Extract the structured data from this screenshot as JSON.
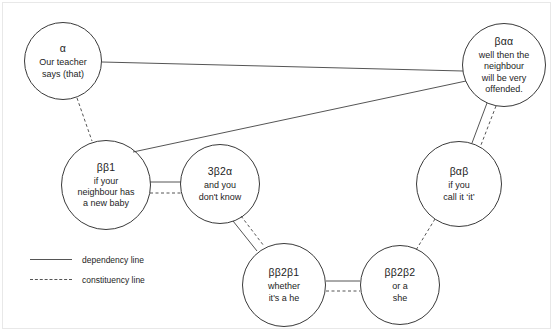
{
  "diagram": {
    "background_color": "#ffffff",
    "line_color": "#555555",
    "node_border_color": "#3a3a3a",
    "text_color": "#1d1d1d",
    "nodes": [
      {
        "id": "alpha",
        "label": "α",
        "text": "Our teacher\nsays (that)",
        "cx": 63,
        "cy": 61,
        "r": 39
      },
      {
        "id": "betaalphaalpha",
        "label": "βαα",
        "text": "well then the\nneighbour\nwill be very\noffended.",
        "cx": 504,
        "cy": 65,
        "r": 42
      },
      {
        "id": "betabeta1",
        "label": "ββ1",
        "text": "if your\nneighbour has\na new baby",
        "cx": 106,
        "cy": 185,
        "r": 45
      },
      {
        "id": "threebeta2alpha",
        "label": "3β2α",
        "text": "and you\ndon't know",
        "cx": 220,
        "cy": 184,
        "r": 40
      },
      {
        "id": "betaalphabeta",
        "label": "βαβ",
        "text": "if you\ncall it ‘it’",
        "cx": 459,
        "cy": 184,
        "r": 43
      },
      {
        "id": "betabeta2beta1",
        "label": "ββ2β1",
        "text": "whether\nit's a he",
        "cx": 284,
        "cy": 285,
        "r": 42
      },
      {
        "id": "betabeta2beta2",
        "label": "ββ2β2",
        "text": "or a\nshe",
        "cx": 400,
        "cy": 285,
        "r": 40
      }
    ],
    "edges": [
      {
        "id": "alpha-to-betaalphaalpha-dependency",
        "kind": "dependency",
        "from": "alpha",
        "to": "betaalphaalpha",
        "x1": 102,
        "y1": 62,
        "x2": 463,
        "y2": 71
      },
      {
        "id": "alpha-to-betabeta1-constituency",
        "kind": "constituency",
        "from": "alpha",
        "to": "betabeta1",
        "x1": 77,
        "y1": 98,
        "x2": 92,
        "y2": 141
      },
      {
        "id": "betabeta1-to-betaalphaalpha-dependency",
        "kind": "dependency",
        "from": "betabeta1",
        "to": "betaalphaalpha",
        "x1": 133,
        "y1": 152,
        "x2": 466,
        "y2": 81
      },
      {
        "id": "betabeta1-to-threebeta2alpha-dependency",
        "kind": "dependency",
        "from": "betabeta1",
        "to": "threebeta2alpha",
        "x1": 150,
        "y1": 182,
        "x2": 181,
        "y2": 182
      },
      {
        "id": "betabeta1-to-threebeta2alpha-constituency",
        "kind": "constituency",
        "from": "betabeta1",
        "to": "threebeta2alpha",
        "x1": 150,
        "y1": 193,
        "x2": 181,
        "y2": 193
      },
      {
        "id": "betaalphaalpha-to-betaalphabeta-dependency",
        "kind": "dependency",
        "from": "betaalphaalpha",
        "to": "betaalphabeta",
        "x1": 487,
        "y1": 103,
        "x2": 472,
        "y2": 143
      },
      {
        "id": "betaalphaalpha-to-betaalphabeta-constituency",
        "kind": "constituency",
        "from": "betaalphaalpha",
        "to": "betaalphabeta",
        "x1": 496,
        "y1": 106,
        "x2": 481,
        "y2": 145
      },
      {
        "id": "threebeta2alpha-to-betabeta2beta1-dependency",
        "kind": "dependency",
        "from": "threebeta2alpha",
        "to": "betabeta2beta1",
        "x1": 233,
        "y1": 221,
        "x2": 257,
        "y2": 251
      },
      {
        "id": "threebeta2alpha-to-betabeta2beta1-constituency",
        "kind": "constituency",
        "from": "threebeta2alpha",
        "to": "betabeta2beta1",
        "x1": 241,
        "y1": 216,
        "x2": 264,
        "y2": 246
      },
      {
        "id": "betaalphabeta-to-betabeta2beta2-constituency",
        "kind": "constituency",
        "from": "betaalphabeta",
        "to": "betabeta2beta2",
        "x1": 435,
        "y1": 219,
        "x2": 416,
        "y2": 250
      },
      {
        "id": "betabeta2beta1-to-betabeta2beta2-dependency",
        "kind": "dependency",
        "from": "betabeta2beta1",
        "to": "betabeta2beta2",
        "x1": 326,
        "y1": 281,
        "x2": 360,
        "y2": 281
      },
      {
        "id": "betabeta2beta1-to-betabeta2beta2-constituency",
        "kind": "constituency",
        "from": "betabeta2beta1",
        "to": "betabeta2beta2",
        "x1": 326,
        "y1": 291,
        "x2": 360,
        "y2": 291
      }
    ]
  },
  "legend": {
    "items": [
      {
        "style": "solid",
        "label": "dependency line"
      },
      {
        "style": "dashed",
        "label": "constituency line"
      }
    ]
  }
}
